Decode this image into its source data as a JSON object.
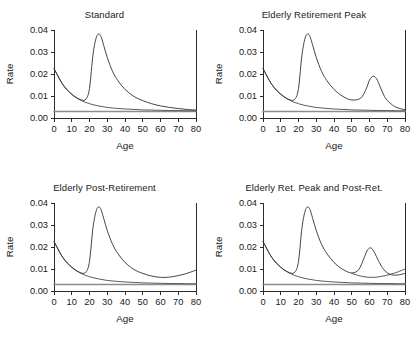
{
  "figure": {
    "panel_count": 4,
    "axis": {
      "xlabel": "Age",
      "ylabel": "Rate",
      "xticks": [
        0,
        10,
        20,
        30,
        40,
        50,
        60,
        70,
        80
      ],
      "xtick_labels": [
        "0",
        "10",
        "20",
        "30",
        "40",
        "50",
        "60",
        "70",
        "80"
      ],
      "yticks": [
        0.0,
        0.01,
        0.02,
        0.03,
        0.04
      ],
      "ytick_labels": [
        "0.00",
        "0.01",
        "0.02",
        "0.03",
        "0.04"
      ],
      "xlim": [
        0,
        80
      ],
      "ylim": [
        0,
        0.04
      ]
    },
    "colors": {
      "curve": "#4a4a4a",
      "curve_dark": "#2f2f2f",
      "baseline": "#8c8c8c",
      "axis": "#2b2b2b",
      "text": "#1a1a1a",
      "background": "#ffffff"
    }
  },
  "chart_data": [
    {
      "type": "line",
      "panel_index": 0,
      "title": "Standard",
      "xlabel": "Age",
      "ylabel": "Rate",
      "xlim": [
        0,
        80
      ],
      "ylim": [
        0,
        0.04
      ],
      "grid": false,
      "legend": "none",
      "components": [
        "constant",
        "pre-labor-force",
        "labor-force",
        "composite"
      ],
      "series": [
        {
          "name": "constant",
          "role": "baseline",
          "x": [
            0,
            80
          ],
          "values": [
            0.003,
            0.003
          ]
        },
        {
          "name": "pre-labor-force",
          "role": "childhood-decline",
          "x": [
            0,
            5,
            10,
            15,
            20,
            25,
            30,
            35,
            40,
            45,
            50,
            55,
            60,
            65,
            70,
            75,
            80
          ],
          "values": [
            0.0225,
            0.0152,
            0.0108,
            0.0081,
            0.0065,
            0.0055,
            0.0048,
            0.0044,
            0.0041,
            0.0039,
            0.0037,
            0.0036,
            0.0035,
            0.0034,
            0.0034,
            0.0033,
            0.0033
          ]
        },
        {
          "name": "composite",
          "role": "total-schedule",
          "x": [
            0,
            5,
            10,
            15,
            18,
            20,
            22,
            24,
            26,
            28,
            30,
            33,
            36,
            40,
            45,
            50,
            55,
            60,
            65,
            70,
            75,
            80
          ],
          "values": [
            0.0225,
            0.0152,
            0.0108,
            0.0083,
            0.0086,
            0.0135,
            0.029,
            0.037,
            0.0378,
            0.033,
            0.0275,
            0.0212,
            0.017,
            0.013,
            0.0098,
            0.0079,
            0.0065,
            0.0055,
            0.0048,
            0.0043,
            0.0039,
            0.0036
          ]
        }
      ],
      "annotations": {
        "labor_force_peak_age": 26,
        "labor_force_peak_rate": 0.0378,
        "start_rate_age0": 0.0225,
        "constant_rate": 0.003
      }
    },
    {
      "type": "line",
      "panel_index": 1,
      "title": "Elderly Retirement Peak",
      "xlabel": "Age",
      "ylabel": "Rate",
      "xlim": [
        0,
        80
      ],
      "ylim": [
        0,
        0.04
      ],
      "grid": false,
      "legend": "none",
      "components": [
        "constant",
        "pre-labor-force",
        "labor-force",
        "retirement-peak",
        "composite"
      ],
      "series": [
        {
          "name": "constant",
          "role": "baseline",
          "x": [
            0,
            80
          ],
          "values": [
            0.003,
            0.003
          ]
        },
        {
          "name": "pre-labor-force",
          "role": "childhood-decline",
          "x": [
            0,
            5,
            10,
            15,
            20,
            25,
            30,
            35,
            40,
            45,
            50,
            55,
            60,
            65,
            70,
            75,
            80
          ],
          "values": [
            0.0225,
            0.0152,
            0.0108,
            0.0081,
            0.0065,
            0.0055,
            0.0048,
            0.0044,
            0.0041,
            0.0039,
            0.0037,
            0.0036,
            0.0035,
            0.0034,
            0.0034,
            0.0033,
            0.0033
          ]
        },
        {
          "name": "composite",
          "role": "total-schedule",
          "x": [
            0,
            5,
            10,
            15,
            18,
            20,
            22,
            24,
            26,
            28,
            30,
            33,
            36,
            40,
            45,
            50,
            55,
            58,
            60,
            62,
            64,
            66,
            68,
            70,
            74,
            78,
            80
          ],
          "values": [
            0.0225,
            0.0152,
            0.0108,
            0.0083,
            0.0086,
            0.0135,
            0.029,
            0.037,
            0.0378,
            0.033,
            0.0275,
            0.0212,
            0.017,
            0.013,
            0.0098,
            0.0082,
            0.009,
            0.013,
            0.0172,
            0.019,
            0.0178,
            0.0142,
            0.0105,
            0.008,
            0.0053,
            0.0041,
            0.0038
          ]
        }
      ],
      "annotations": {
        "labor_force_peak_age": 26,
        "labor_force_peak_rate": 0.0378,
        "retirement_peak_age": 62,
        "retirement_peak_rate": 0.019,
        "constant_rate": 0.003
      }
    },
    {
      "type": "line",
      "panel_index": 2,
      "title": "Elderly Post-Retirement",
      "xlabel": "Age",
      "ylabel": "Rate",
      "xlim": [
        0,
        80
      ],
      "ylim": [
        0,
        0.04
      ],
      "grid": false,
      "legend": "none",
      "components": [
        "constant",
        "pre-labor-force",
        "labor-force",
        "post-retirement-rise",
        "composite"
      ],
      "series": [
        {
          "name": "constant",
          "role": "baseline",
          "x": [
            0,
            80
          ],
          "values": [
            0.003,
            0.003
          ]
        },
        {
          "name": "pre-labor-force",
          "role": "childhood-decline",
          "x": [
            0,
            5,
            10,
            15,
            20,
            25,
            30,
            35,
            40,
            45,
            50,
            55,
            60,
            65,
            70,
            75,
            80
          ],
          "values": [
            0.0225,
            0.0152,
            0.0108,
            0.0081,
            0.0065,
            0.0055,
            0.0048,
            0.0044,
            0.0041,
            0.0039,
            0.0037,
            0.0036,
            0.0035,
            0.0034,
            0.0034,
            0.0033,
            0.0033
          ]
        },
        {
          "name": "composite",
          "role": "total-schedule",
          "x": [
            0,
            5,
            10,
            15,
            18,
            20,
            22,
            24,
            26,
            28,
            30,
            33,
            36,
            40,
            45,
            50,
            55,
            60,
            65,
            70,
            74,
            77,
            80
          ],
          "values": [
            0.0225,
            0.0152,
            0.0108,
            0.0083,
            0.0086,
            0.0135,
            0.029,
            0.037,
            0.0378,
            0.033,
            0.0275,
            0.0212,
            0.017,
            0.013,
            0.0098,
            0.008,
            0.0068,
            0.0062,
            0.0063,
            0.007,
            0.0078,
            0.0086,
            0.0095
          ]
        }
      ],
      "annotations": {
        "labor_force_peak_age": 26,
        "labor_force_peak_rate": 0.0378,
        "post_retirement_rate_age80": 0.0095,
        "post_retirement_upturn_age": 60,
        "constant_rate": 0.003
      }
    },
    {
      "type": "line",
      "panel_index": 3,
      "title": "Elderly Ret. Peak and Post-Ret.",
      "xlabel": "Age",
      "ylabel": "Rate",
      "xlim": [
        0,
        80
      ],
      "ylim": [
        0,
        0.04
      ],
      "grid": false,
      "legend": "none",
      "components": [
        "constant",
        "pre-labor-force",
        "labor-force",
        "retirement-peak",
        "post-retirement-rise",
        "composite"
      ],
      "series": [
        {
          "name": "constant",
          "role": "baseline",
          "x": [
            0,
            80
          ],
          "values": [
            0.003,
            0.003
          ]
        },
        {
          "name": "pre-labor-force",
          "role": "childhood-decline",
          "x": [
            0,
            5,
            10,
            15,
            20,
            25,
            30,
            35,
            40,
            45,
            50,
            55,
            60,
            65,
            70,
            75,
            80
          ],
          "values": [
            0.0225,
            0.0152,
            0.0108,
            0.0081,
            0.0065,
            0.0055,
            0.0048,
            0.0044,
            0.0041,
            0.0039,
            0.0037,
            0.0036,
            0.0035,
            0.0034,
            0.0034,
            0.0033,
            0.0033
          ]
        },
        {
          "name": "post-retirement-only",
          "role": "secondary-tail",
          "x": [
            50,
            55,
            60,
            65,
            70,
            74,
            77,
            80
          ],
          "values": [
            0.008,
            0.0068,
            0.0062,
            0.0064,
            0.0072,
            0.0081,
            0.009,
            0.01
          ]
        },
        {
          "name": "composite",
          "role": "total-schedule",
          "x": [
            0,
            5,
            10,
            15,
            18,
            20,
            22,
            24,
            26,
            28,
            30,
            33,
            36,
            40,
            45,
            50,
            54,
            57,
            59,
            61,
            63,
            65,
            68,
            71,
            74,
            77,
            80
          ],
          "values": [
            0.0225,
            0.0152,
            0.0108,
            0.0083,
            0.0086,
            0.0135,
            0.029,
            0.037,
            0.0378,
            0.033,
            0.0275,
            0.0212,
            0.017,
            0.013,
            0.0098,
            0.0082,
            0.0098,
            0.0152,
            0.0188,
            0.0195,
            0.0172,
            0.0138,
            0.0098,
            0.0078,
            0.0072,
            0.0074,
            0.008
          ]
        }
      ],
      "annotations": {
        "labor_force_peak_age": 26,
        "labor_force_peak_rate": 0.0378,
        "retirement_peak_age": 61,
        "retirement_peak_rate": 0.0195,
        "post_retirement_rate_age80": 0.01,
        "constant_rate": 0.003
      }
    }
  ]
}
